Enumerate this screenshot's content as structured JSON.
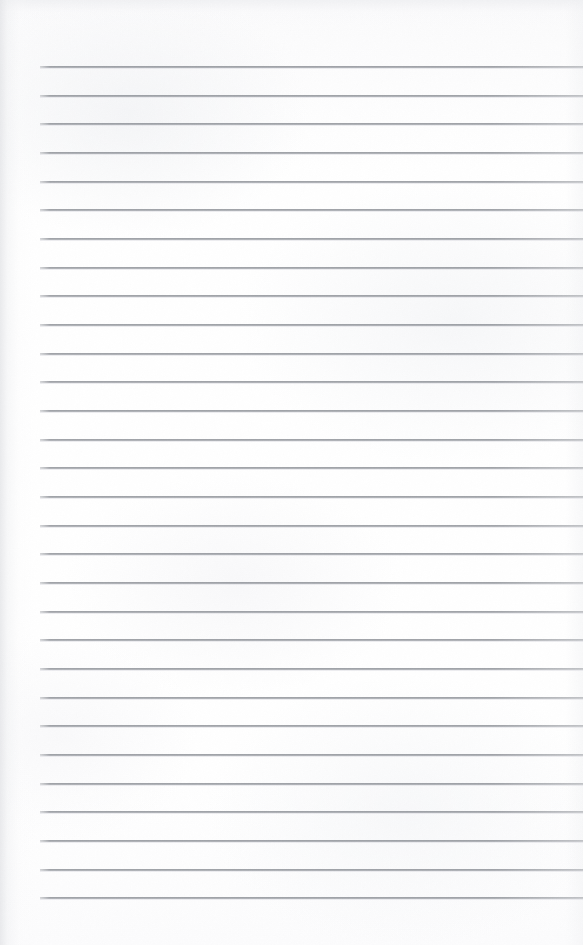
{
  "document": {
    "kind": "scanned-lined-paper",
    "description": "Blank ruled notebook page, scanned",
    "page_width": 583,
    "page_height": 945,
    "paper_color": "#fdfdfd",
    "rule_color": "#7a7e85",
    "rule_thickness_px": 2,
    "visible_text": "",
    "ruling": {
      "line_count": 30,
      "first_line_y": 66,
      "last_line_y": 897,
      "line_spacing_px": 28.65,
      "line_start_x": 40,
      "line_end_x": 583,
      "left_margin_px": 40,
      "top_margin_px": 66,
      "bottom_margin_px": 48,
      "margin_rule_visible": false
    },
    "lines": [
      {
        "index": 1,
        "y": 66,
        "content": ""
      },
      {
        "index": 2,
        "y": 95,
        "content": ""
      },
      {
        "index": 3,
        "y": 123,
        "content": ""
      },
      {
        "index": 4,
        "y": 152,
        "content": ""
      },
      {
        "index": 5,
        "y": 181,
        "content": ""
      },
      {
        "index": 6,
        "y": 209,
        "content": ""
      },
      {
        "index": 7,
        "y": 238,
        "content": ""
      },
      {
        "index": 8,
        "y": 267,
        "content": ""
      },
      {
        "index": 9,
        "y": 295,
        "content": ""
      },
      {
        "index": 10,
        "y": 324,
        "content": ""
      },
      {
        "index": 11,
        "y": 353,
        "content": ""
      },
      {
        "index": 12,
        "y": 381,
        "content": ""
      },
      {
        "index": 13,
        "y": 410,
        "content": ""
      },
      {
        "index": 14,
        "y": 439,
        "content": ""
      },
      {
        "index": 15,
        "y": 467,
        "content": ""
      },
      {
        "index": 16,
        "y": 496,
        "content": ""
      },
      {
        "index": 17,
        "y": 525,
        "content": ""
      },
      {
        "index": 18,
        "y": 553,
        "content": ""
      },
      {
        "index": 19,
        "y": 582,
        "content": ""
      },
      {
        "index": 20,
        "y": 611,
        "content": ""
      },
      {
        "index": 21,
        "y": 639,
        "content": ""
      },
      {
        "index": 22,
        "y": 668,
        "content": ""
      },
      {
        "index": 23,
        "y": 697,
        "content": ""
      },
      {
        "index": 24,
        "y": 725,
        "content": ""
      },
      {
        "index": 25,
        "y": 754,
        "content": ""
      },
      {
        "index": 26,
        "y": 783,
        "content": ""
      },
      {
        "index": 27,
        "y": 811,
        "content": ""
      },
      {
        "index": 28,
        "y": 840,
        "content": ""
      },
      {
        "index": 29,
        "y": 869,
        "content": ""
      },
      {
        "index": 30,
        "y": 897,
        "content": ""
      }
    ]
  }
}
